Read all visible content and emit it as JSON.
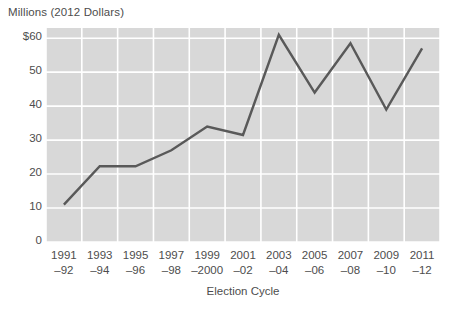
{
  "chart_data": {
    "type": "line",
    "title": "",
    "ylabel": "Millions (2012 Dollars)",
    "xlabel": "Election Cycle",
    "categories": [
      "1991–92",
      "1993–94",
      "1995–96",
      "1997–98",
      "1999–2000",
      "2001–02",
      "2003–04",
      "2005–06",
      "2007–08",
      "2009–10",
      "2011–12"
    ],
    "category_lines": [
      [
        "1991",
        "–92"
      ],
      [
        "1993",
        "–94"
      ],
      [
        "1995",
        "–96"
      ],
      [
        "1997",
        "–98"
      ],
      [
        "1999",
        "–2000"
      ],
      [
        "2001",
        "–02"
      ],
      [
        "2003",
        "–04"
      ],
      [
        "2005",
        "–06"
      ],
      [
        "2007",
        "–08"
      ],
      [
        "2009",
        "–10"
      ],
      [
        "2011",
        "–12"
      ]
    ],
    "values": [
      11,
      22.3,
      22.3,
      27,
      34,
      31.5,
      61,
      44,
      58.5,
      39,
      57
    ],
    "ylim": [
      0,
      63
    ],
    "yticks": [
      0,
      10,
      20,
      30,
      40,
      50,
      60
    ],
    "ytick_labels": [
      "0",
      "10",
      "20",
      "30",
      "40",
      "50",
      "$60"
    ],
    "grid": true,
    "legend": "none",
    "series_color": "#595959",
    "plot_background": "#d8d8d8",
    "gridline_color": "#ffffff"
  }
}
